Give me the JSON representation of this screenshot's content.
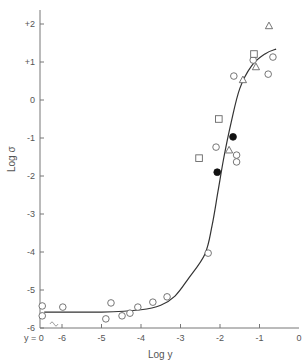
{
  "chart_data": {
    "type": "scatter",
    "title": "",
    "xlabel": "Log y",
    "ylabel": "Log σ",
    "xlim": [
      -6.3,
      0
    ],
    "ylim": [
      -6,
      2.6
    ],
    "x_ticks": [
      -6,
      -5,
      -4,
      -3,
      -2,
      -1,
      0
    ],
    "x_tick_labels": [
      "-6",
      "-5",
      "-4",
      "-3",
      "-2",
      "-1",
      "0"
    ],
    "y_ticks": [
      2,
      1,
      0,
      -1,
      -2,
      -3,
      -4,
      -5,
      -6
    ],
    "y_tick_labels": [
      "+2",
      "+1",
      "0",
      "-1",
      "-2",
      "-3",
      "-4",
      "-5",
      "-6"
    ],
    "x_break_label": "y = 0",
    "grid": false,
    "legend": "none",
    "series": [
      {
        "name": "open-circles",
        "marker": "circle-open",
        "points": [
          {
            "x": -6.5,
            "y": -5.42
          },
          {
            "x": -6.5,
            "y": -5.68
          },
          {
            "x": -5.98,
            "y": -5.45
          },
          {
            "x": -4.76,
            "y": -5.34
          },
          {
            "x": -4.89,
            "y": -5.76
          },
          {
            "x": -4.48,
            "y": -5.68
          },
          {
            "x": -4.28,
            "y": -5.61
          },
          {
            "x": -4.08,
            "y": -5.45
          },
          {
            "x": -3.7,
            "y": -5.32
          },
          {
            "x": -3.34,
            "y": -5.18
          },
          {
            "x": -2.3,
            "y": -4.03
          },
          {
            "x": -2.1,
            "y": -1.24
          },
          {
            "x": -1.58,
            "y": -1.45
          },
          {
            "x": -1.58,
            "y": -1.63
          },
          {
            "x": -1.65,
            "y": 0.63
          },
          {
            "x": -1.16,
            "y": 1.05
          },
          {
            "x": -0.66,
            "y": 1.13
          },
          {
            "x": -0.78,
            "y": 0.68
          }
        ]
      },
      {
        "name": "filled-circles",
        "marker": "circle-filled",
        "points": [
          {
            "x": -1.67,
            "y": -0.97
          },
          {
            "x": -2.07,
            "y": -1.9
          }
        ]
      },
      {
        "name": "squares",
        "marker": "square-open",
        "points": [
          {
            "x": -2.03,
            "y": -0.5
          },
          {
            "x": -2.53,
            "y": -1.53
          },
          {
            "x": -1.14,
            "y": 1.21
          }
        ]
      },
      {
        "name": "triangles",
        "marker": "triangle-open",
        "points": [
          {
            "x": -0.76,
            "y": 1.95
          },
          {
            "x": -1.09,
            "y": 0.87
          },
          {
            "x": -1.42,
            "y": 0.53
          },
          {
            "x": -1.77,
            "y": -1.32
          }
        ]
      }
    ],
    "fit_curve": [
      {
        "x": -6.45,
        "y": -5.58
      },
      {
        "x": -5,
        "y": -5.58
      },
      {
        "x": -4,
        "y": -5.52
      },
      {
        "x": -3.5,
        "y": -5.4
      },
      {
        "x": -3.14,
        "y": -5.16
      },
      {
        "x": -2.8,
        "y": -4.7
      },
      {
        "x": -2.38,
        "y": -4.05
      },
      {
        "x": -2.2,
        "y": -3.3
      },
      {
        "x": -2.05,
        "y": -2.4
      },
      {
        "x": -1.9,
        "y": -1.5
      },
      {
        "x": -1.72,
        "y": -0.6
      },
      {
        "x": -1.5,
        "y": 0.3
      },
      {
        "x": -1.2,
        "y": 0.9
      },
      {
        "x": -0.85,
        "y": 1.22
      },
      {
        "x": -0.58,
        "y": 1.34
      }
    ]
  }
}
